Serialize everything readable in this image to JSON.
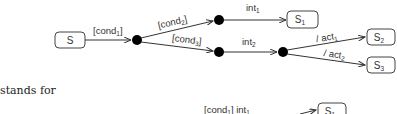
{
  "diagram": {
    "states": [
      {
        "id": "S",
        "label": "S",
        "sub": ""
      },
      {
        "id": "S1",
        "label": "S",
        "sub": "1"
      },
      {
        "id": "S2",
        "label": "S",
        "sub": "2"
      },
      {
        "id": "S3",
        "label": "S",
        "sub": "3"
      }
    ],
    "junctions": [
      "j1",
      "j2",
      "j3",
      "j4"
    ],
    "transitions": [
      {
        "from": "S",
        "to": "j1",
        "label": "[cond",
        "sub": "1",
        "suffix": "]"
      },
      {
        "from": "j1",
        "to": "j2",
        "label": "[cond",
        "sub": "2",
        "suffix": "]"
      },
      {
        "from": "j1",
        "to": "j3",
        "label": "[cond",
        "sub": "3",
        "suffix": "]"
      },
      {
        "from": "j2",
        "to": "S1",
        "label": "int",
        "sub": "1",
        "suffix": ""
      },
      {
        "from": "j3",
        "to": "j4",
        "label": "int",
        "sub": "2",
        "suffix": ""
      },
      {
        "from": "j4",
        "to": "S2",
        "label": "/ act",
        "sub": "1",
        "suffix": ""
      },
      {
        "from": "j4",
        "to": "S3",
        "label": "/ act",
        "sub": "2",
        "suffix": ""
      }
    ],
    "colors": {
      "line": "#333333",
      "junction": "#000000",
      "box_border": "#444444"
    }
  },
  "text": {
    "stands_for": "stands for"
  },
  "partial": {
    "label": "[cond",
    "sub": "1",
    "mid": "] int",
    "sub2": "1",
    "state_label": "S",
    "state_sub": "1"
  }
}
